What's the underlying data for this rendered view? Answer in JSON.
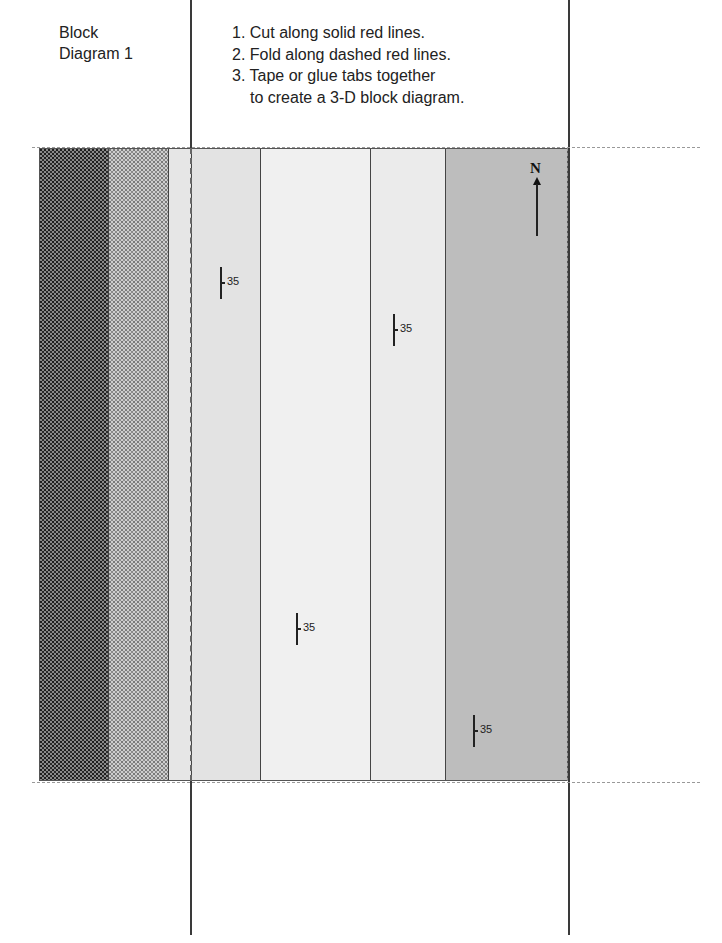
{
  "title": {
    "line1": "Block",
    "line2": "Diagram 1"
  },
  "instructions": [
    {
      "num": "1.",
      "text": "Cut along solid red lines."
    },
    {
      "num": "2.",
      "text": "Fold along dashed red lines."
    },
    {
      "num": "3.",
      "text": "Tape or glue tabs together",
      "continuation": "to create a 3-D block diagram."
    }
  ],
  "north_arrow": {
    "label": "N"
  },
  "bands": [
    {
      "id": "band-1",
      "pattern": "dense-dark-stipple",
      "color": "#8a8a8a"
    },
    {
      "id": "band-2",
      "pattern": "light-stipple",
      "color": "#cfcfcf"
    },
    {
      "id": "band-3",
      "pattern": "solid",
      "color": "#e6e6e6"
    },
    {
      "id": "band-4",
      "pattern": "solid",
      "color": "#e3e3e3"
    },
    {
      "id": "band-5",
      "pattern": "solid",
      "color": "#f0f0f0"
    },
    {
      "id": "band-6",
      "pattern": "solid",
      "color": "#ebebeb"
    },
    {
      "id": "band-7",
      "pattern": "solid",
      "color": "#bdbdbd"
    }
  ],
  "strike_dip_symbols": [
    {
      "dip": "35"
    },
    {
      "dip": "35"
    },
    {
      "dip": "35"
    },
    {
      "dip": "35"
    }
  ]
}
